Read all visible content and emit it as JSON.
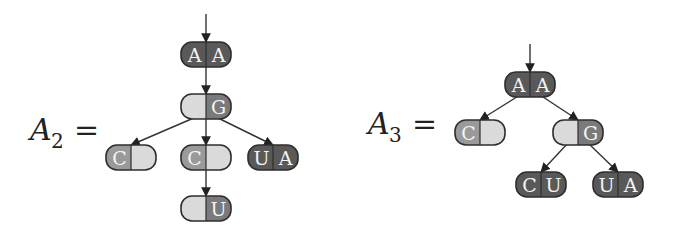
{
  "colors": {
    "dark": "#595959",
    "light": "#dadada",
    "mid": "#9a9a9a",
    "midDark": "#7a7a7a",
    "stroke": "#2e2e2e",
    "edge": "#333333"
  },
  "trees": [
    {
      "label": "A",
      "subscript": "2",
      "equals": "=",
      "entry_arrow": {
        "x": 206,
        "y1": 14,
        "y2": 42
      },
      "nodes": [
        {
          "id": "AA",
          "left": "A",
          "right": "A",
          "x": 181,
          "y": 42,
          "leftFill": "dark",
          "rightFill": "dark"
        },
        {
          "id": "G",
          "left": "",
          "right": "G",
          "x": 181,
          "y": 94,
          "leftFill": "light",
          "rightFill": "midDark"
        },
        {
          "id": "C1",
          "left": "C",
          "right": "",
          "x": 106,
          "y": 145,
          "leftFill": "mid",
          "rightFill": "light"
        },
        {
          "id": "C2",
          "left": "C",
          "right": "",
          "x": 181,
          "y": 145,
          "leftFill": "mid",
          "rightFill": "light"
        },
        {
          "id": "UA",
          "left": "U",
          "right": "A",
          "x": 248,
          "y": 145,
          "leftFill": "dark",
          "rightFill": "dark"
        },
        {
          "id": "U",
          "left": "",
          "right": "U",
          "x": 181,
          "y": 196,
          "leftFill": "light",
          "rightFill": "midDark"
        }
      ],
      "edges": [
        {
          "from": "AA",
          "to": "G"
        },
        {
          "from": "G",
          "to": "C1"
        },
        {
          "from": "G",
          "to": "C2"
        },
        {
          "from": "G",
          "to": "UA"
        },
        {
          "from": "C2",
          "to": "U"
        }
      ]
    },
    {
      "label": "A",
      "subscript": "3",
      "equals": "=",
      "entry_arrow": {
        "x": 530,
        "y1": 44,
        "y2": 72
      },
      "nodes": [
        {
          "id": "AA",
          "left": "A",
          "right": "A",
          "x": 505,
          "y": 72,
          "leftFill": "dark",
          "rightFill": "dark"
        },
        {
          "id": "C",
          "left": "C",
          "right": "",
          "x": 455,
          "y": 120,
          "leftFill": "mid",
          "rightFill": "light"
        },
        {
          "id": "G",
          "left": "",
          "right": "G",
          "x": 553,
          "y": 120,
          "leftFill": "light",
          "rightFill": "midDark"
        },
        {
          "id": "CU",
          "left": "C",
          "right": "U",
          "x": 516,
          "y": 172,
          "leftFill": "dark",
          "rightFill": "dark"
        },
        {
          "id": "UA",
          "left": "U",
          "right": "A",
          "x": 593,
          "y": 172,
          "leftFill": "dark",
          "rightFill": "dark"
        }
      ],
      "edges": [
        {
          "from": "AA",
          "to": "C"
        },
        {
          "from": "AA",
          "to": "G"
        },
        {
          "from": "G",
          "to": "CU"
        },
        {
          "from": "G",
          "to": "UA"
        }
      ]
    }
  ],
  "labels": [
    {
      "x": 30,
      "y": 140,
      "main": "A",
      "sub": "2",
      "eq": "="
    },
    {
      "x": 368,
      "y": 134,
      "main": "A",
      "sub": "3",
      "eq": "="
    }
  ],
  "node_size": {
    "w": 50,
    "h": 25,
    "r": 11
  }
}
